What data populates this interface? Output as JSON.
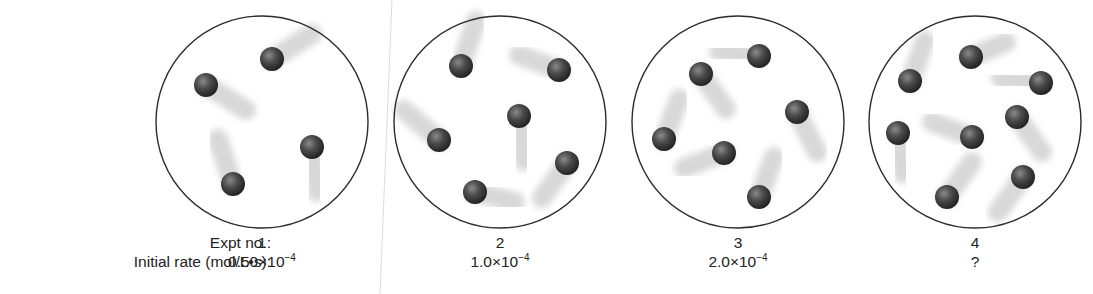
{
  "labels": {
    "expt_no": "Expt no.:",
    "initial_rate": "Initial rate (mol/L•s):"
  },
  "experiments": [
    {
      "no": "1",
      "rate_mantissa": "0.50×10",
      "rate_exp": "−4",
      "cx": 262,
      "particles": [
        [
          206,
          85,
          40,
          25
        ],
        [
          272,
          59,
          40,
          -25
        ],
        [
          312,
          147,
          5,
          45
        ],
        [
          233,
          184,
          -15,
          -45
        ]
      ]
    },
    {
      "no": "2",
      "rate_mantissa": "1.0×10",
      "rate_exp": "−4",
      "cx": 500,
      "particles": [
        [
          461,
          66,
          15,
          -45
        ],
        [
          559,
          70,
          -40,
          -15
        ],
        [
          519,
          116,
          5,
          45
        ],
        [
          439,
          140,
          -35,
          -30
        ],
        [
          567,
          163,
          -25,
          35
        ],
        [
          475,
          192,
          40,
          10
        ]
      ]
    },
    {
      "no": "3",
      "rate_mantissa": "2.0×10",
      "rate_exp": "−4",
      "cx": 738,
      "particles": [
        [
          759,
          56,
          -40,
          -5
        ],
        [
          701,
          74,
          25,
          35
        ],
        [
          797,
          112,
          20,
          40
        ],
        [
          664,
          139,
          15,
          -40
        ],
        [
          724,
          153,
          -40,
          15
        ],
        [
          759,
          197,
          15,
          -40
        ]
      ]
    },
    {
      "no": "4",
      "rate_mantissa": "",
      "rate_exp": "",
      "rate_unknown": "?",
      "cx": 975,
      "particles": [
        [
          971,
          57,
          35,
          -15
        ],
        [
          910,
          81,
          15,
          -40
        ],
        [
          1041,
          83,
          -40,
          -5
        ],
        [
          1017,
          117,
          25,
          35
        ],
        [
          898,
          133,
          5,
          40
        ],
        [
          972,
          137,
          -40,
          -15
        ],
        [
          1023,
          177,
          -25,
          35
        ],
        [
          947,
          197,
          25,
          -35
        ]
      ]
    }
  ],
  "colors": {
    "circle_stroke": "#2b2b2b",
    "particle": "#3a3a3a",
    "trail": "#c8c8c8",
    "divider": "#d8d8d8"
  }
}
